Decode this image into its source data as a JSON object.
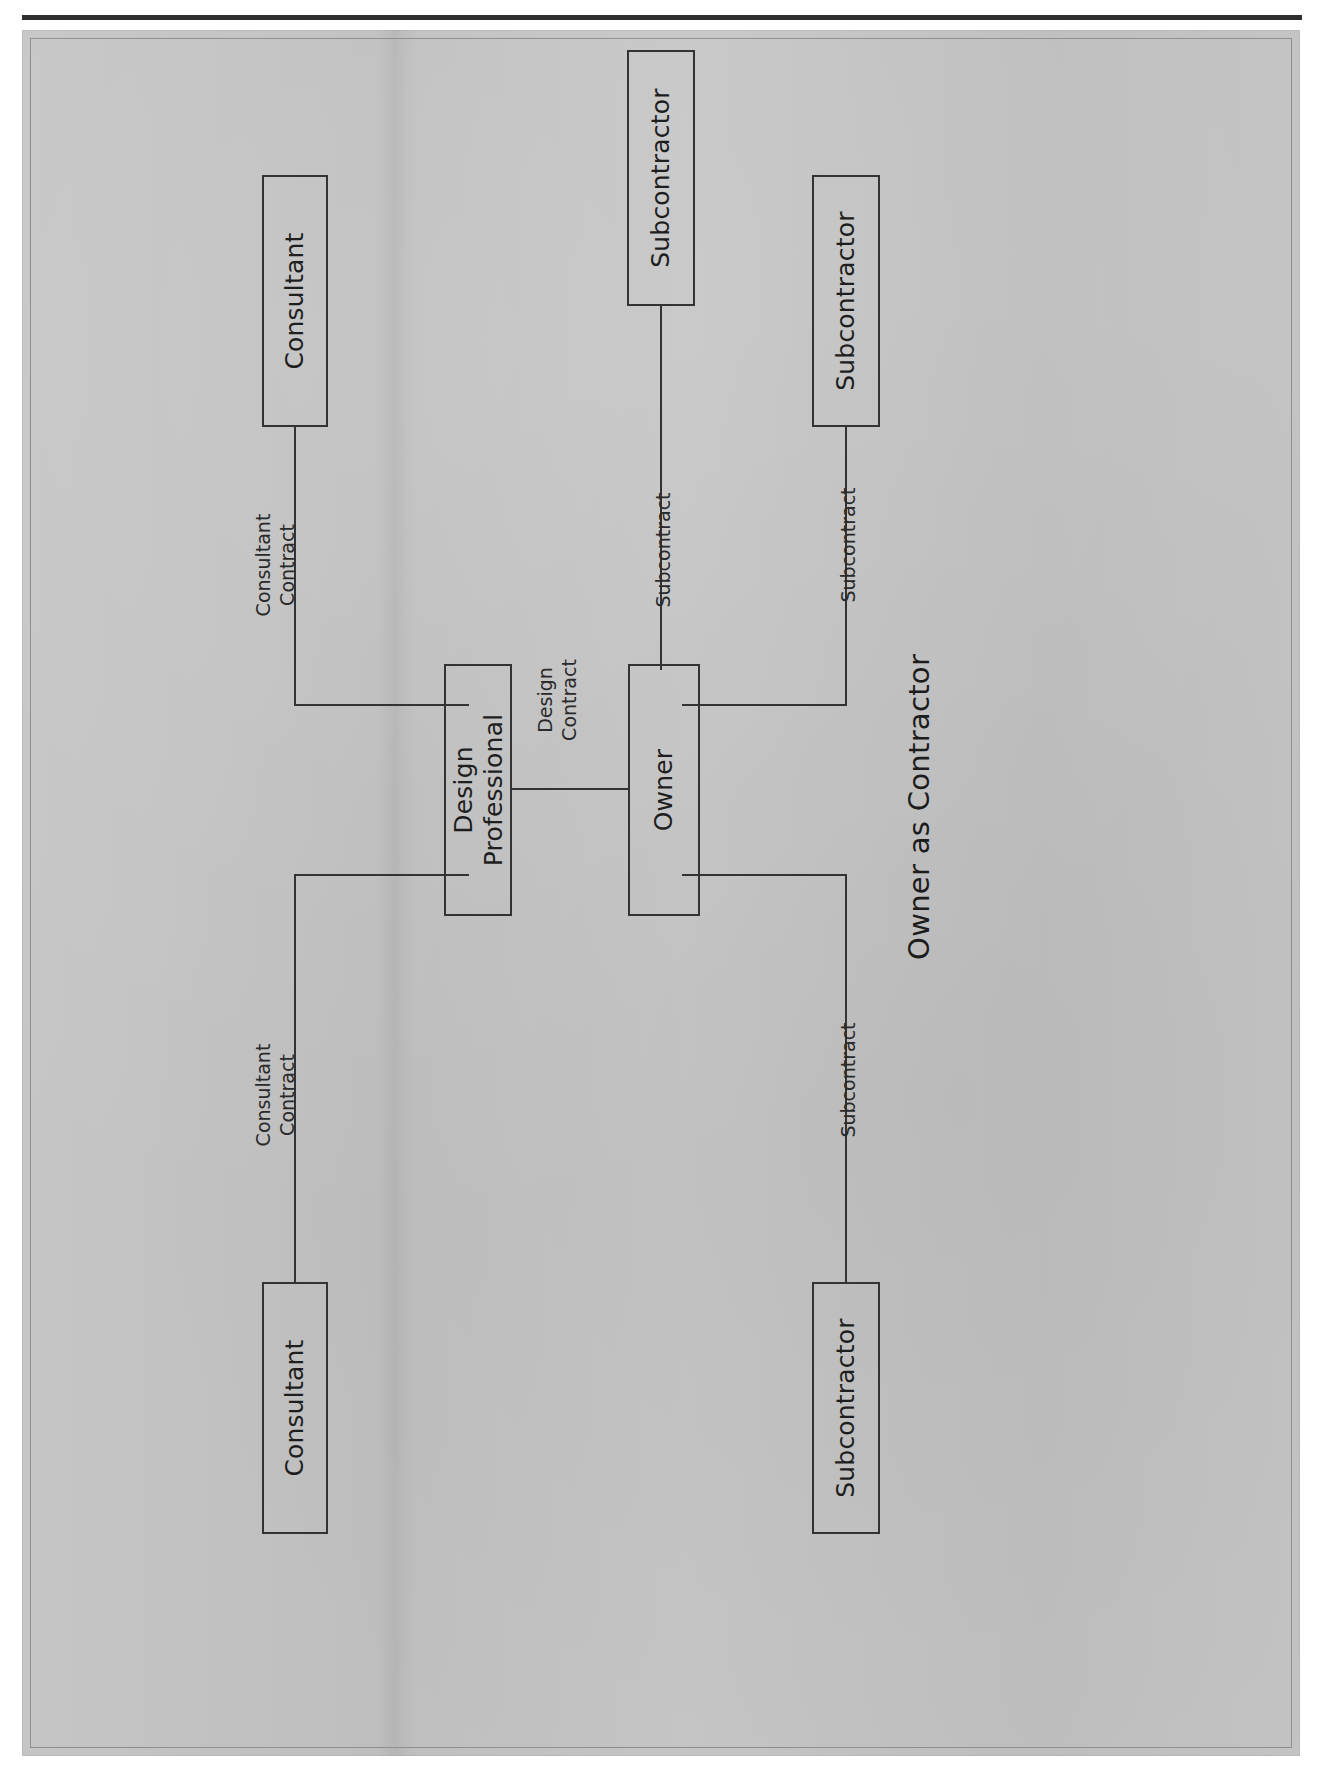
{
  "figure": {
    "caption": "Owner as Contractor",
    "diagram_type": "contract-relationship-tree",
    "orientation": "rotated-90-counterclockwise",
    "page_background": "#c2c2c2",
    "line_color": "#333333",
    "text_color": "#1e1e1e"
  },
  "nodes": [
    {
      "id": "owner",
      "label": "Owner"
    },
    {
      "id": "design-professional",
      "label": "Design\nProfessional"
    },
    {
      "id": "consultant-top",
      "label": "Consultant"
    },
    {
      "id": "consultant-bottom",
      "label": "Consultant"
    },
    {
      "id": "subcontractor-1",
      "label": "Subcontractor"
    },
    {
      "id": "subcontractor-2",
      "label": "Subcontractor"
    },
    {
      "id": "subcontractor-3",
      "label": "Subcontractor"
    }
  ],
  "edges": [
    {
      "id": "owner-design",
      "from": "owner",
      "to": "design-professional",
      "label": "Design\nContract"
    },
    {
      "id": "design-consultant-1",
      "from": "design-professional",
      "to": "consultant-top",
      "label": "Consultant\nContract"
    },
    {
      "id": "design-consultant-2",
      "from": "design-professional",
      "to": "consultant-bottom",
      "label": "Consultant\nContract"
    },
    {
      "id": "owner-sub-1",
      "from": "owner",
      "to": "subcontractor-1",
      "label": "Subcontract"
    },
    {
      "id": "owner-sub-2",
      "from": "owner",
      "to": "subcontractor-2",
      "label": "Subcontract"
    },
    {
      "id": "owner-sub-3",
      "from": "owner",
      "to": "subcontractor-3",
      "label": "Subcontract"
    }
  ]
}
